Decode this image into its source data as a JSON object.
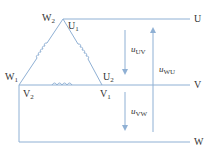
{
  "diagram": {
    "type": "delta-connection-voltage-diagram",
    "colors": {
      "line": "#8fb0d4",
      "coil": "#8fb0d4",
      "text": "#333333"
    },
    "terminals": {
      "U": "U",
      "V": "V",
      "W": "W"
    },
    "nodes": {
      "W2": {
        "main": "W",
        "sub": "2"
      },
      "U1": {
        "main": "U",
        "sub": "1"
      },
      "W1": {
        "main": "W",
        "sub": "1"
      },
      "U2": {
        "main": "U",
        "sub": "2"
      },
      "V2": {
        "main": "V",
        "sub": "2"
      },
      "V1": {
        "main": "V",
        "sub": "1"
      }
    },
    "voltages": {
      "uUV": {
        "main": "u",
        "sub": "UV",
        "direction": "down"
      },
      "uWU": {
        "main": "u",
        "sub": "WU",
        "direction": "up"
      },
      "uVW": {
        "main": "u",
        "sub": "VW",
        "direction": "down"
      }
    }
  }
}
